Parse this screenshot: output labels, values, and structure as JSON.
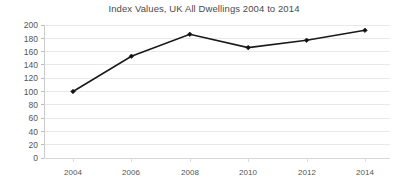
{
  "chart_data": {
    "type": "line",
    "title": "Index Values, UK All Dwellings 2004 to 2014",
    "xlabel": "",
    "ylabel": "",
    "categories": [
      "2004",
      "2006",
      "2008",
      "2010",
      "2012",
      "2014"
    ],
    "x": [
      2004,
      2006,
      2008,
      2010,
      2012,
      2014
    ],
    "values": [
      100,
      153,
      186,
      166,
      177,
      192
    ],
    "series": [
      {
        "name": "Index Values, UK All Dwellings",
        "values": [
          100,
          153,
          186,
          166,
          177,
          192
        ]
      }
    ],
    "ylim": [
      0,
      200
    ],
    "ytick_step": 20,
    "ytick_labels": [
      "200",
      "180",
      "160",
      "140",
      "120",
      "100",
      "80",
      "60",
      "40",
      "20",
      "0"
    ],
    "ytick_values": [
      200,
      180,
      160,
      140,
      120,
      100,
      80,
      60,
      40,
      20,
      0
    ],
    "xtick_labels": [
      "2004",
      "2006",
      "2008",
      "2010",
      "2012",
      "2014"
    ],
    "grid": "horizontal",
    "legend": "none",
    "marker": "diamond",
    "colors": {
      "line": "#1a1a1a",
      "marker": "#111111",
      "gridline": "#e9e9e9",
      "axis": "#cccccc",
      "title_text": "#4a4a4a",
      "tick_text": "#555555",
      "background": "#ffffff"
    }
  }
}
